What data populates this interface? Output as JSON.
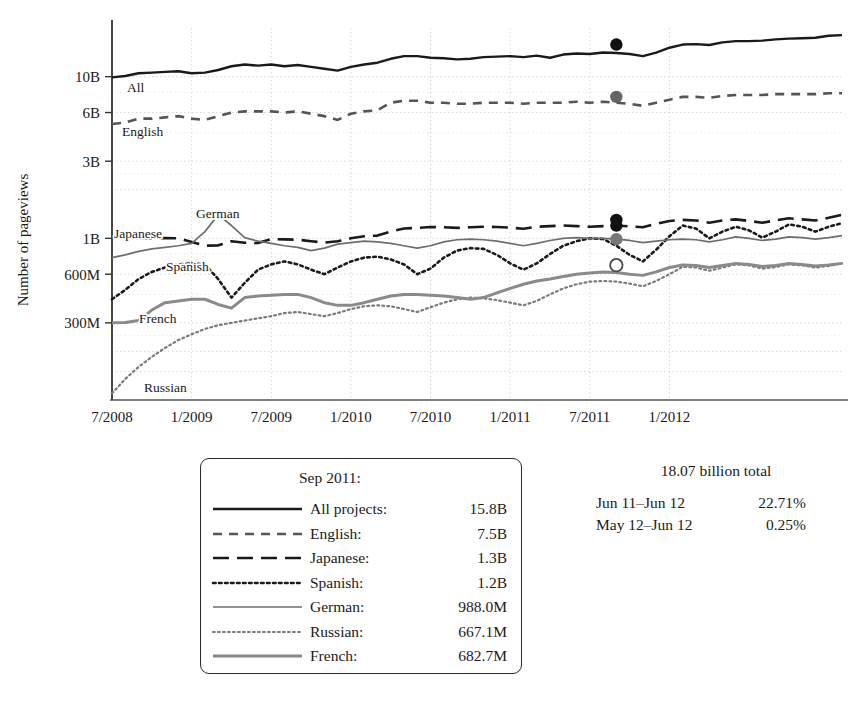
{
  "chart_data": {
    "type": "line",
    "title": "",
    "xlabel": "",
    "ylabel": "Number of pageviews",
    "scale": "log",
    "grid": true,
    "legend_position": "below-left",
    "x_tick_labels": [
      "7/2008",
      "1/2009",
      "7/2009",
      "1/2010",
      "7/2010",
      "1/2011",
      "7/2011",
      "1/2012"
    ],
    "y_tick_labels": [
      "10B",
      "6B",
      "3B",
      "1B",
      "600M",
      "300M"
    ],
    "y_tick_values": [
      10000,
      6000,
      3000,
      1000,
      600,
      300
    ],
    "ylim": [
      100,
      20000
    ],
    "x_start": "7/2008",
    "x_end": "6/2012",
    "highlight_month": "Sep 2011",
    "series": [
      {
        "name": "All projects",
        "short_name": "All",
        "style": "solid",
        "color": "#1a1a1a",
        "width": 2.4,
        "inline_label": "All",
        "marker": {
          "type": "filled",
          "color": "#111111",
          "month": "Sep 2011",
          "value": 15800
        },
        "values": [
          9900,
          10100,
          10500,
          10600,
          10700,
          10800,
          10500,
          10600,
          11000,
          11600,
          11900,
          11700,
          11900,
          11600,
          11800,
          11500,
          11200,
          10900,
          11500,
          11900,
          12200,
          12900,
          13400,
          13400,
          13100,
          13000,
          12800,
          12900,
          13200,
          13300,
          13400,
          13200,
          13500,
          13100,
          13700,
          13900,
          13800,
          14100,
          14000,
          13800,
          13400,
          14100,
          15100,
          15800,
          15900,
          15700,
          16300,
          16600,
          16600,
          16700,
          17000,
          17200,
          17300,
          17400,
          17900,
          18070
        ]
      },
      {
        "name": "English",
        "short_name": "English",
        "style": "dashed",
        "color": "#555555",
        "width": 2.6,
        "inline_label": "English",
        "marker": {
          "type": "filled",
          "color": "#666666",
          "month": "Sep 2011",
          "value": 7500
        },
        "values": [
          5100,
          5200,
          5500,
          5500,
          5600,
          5700,
          5500,
          5400,
          5700,
          6000,
          6100,
          6100,
          6100,
          6000,
          6100,
          5900,
          5700,
          5400,
          5900,
          6100,
          6200,
          6900,
          7100,
          7100,
          6900,
          6900,
          6800,
          6800,
          6900,
          6900,
          6900,
          6800,
          6900,
          6900,
          6900,
          7000,
          6900,
          7000,
          6900,
          6800,
          6600,
          6900,
          7200,
          7500,
          7500,
          7400,
          7600,
          7700,
          7700,
          7700,
          7800,
          7800,
          7800,
          7800,
          7900,
          7900
        ]
      },
      {
        "name": "Japanese",
        "short_name": "Japanese",
        "style": "longdash",
        "color": "#1a1a1a",
        "width": 2.6,
        "inline_label": "Japanese",
        "marker": {
          "type": "filled",
          "color": "#111111",
          "month": "Sep 2011",
          "value": 1300
        },
        "values": [
          1010,
          1010,
          1000,
          1000,
          1005,
          1000,
          950,
          900,
          905,
          960,
          940,
          935,
          990,
          985,
          980,
          960,
          940,
          960,
          1000,
          1030,
          1040,
          1100,
          1150,
          1160,
          1175,
          1170,
          1160,
          1170,
          1180,
          1175,
          1165,
          1145,
          1180,
          1190,
          1200,
          1190,
          1180,
          1190,
          1200,
          1185,
          1170,
          1230,
          1280,
          1300,
          1290,
          1250,
          1290,
          1310,
          1280,
          1250,
          1290,
          1330,
          1310,
          1290,
          1340,
          1400
        ]
      },
      {
        "name": "Spanish",
        "short_name": "Spanish",
        "style": "dotted",
        "color": "#1a1a1a",
        "width": 2.6,
        "inline_label": "Spanish",
        "marker": {
          "type": "filled",
          "color": "#111111",
          "month": "Sep 2011",
          "value": 1200
        },
        "values": [
          420,
          480,
          560,
          620,
          660,
          690,
          700,
          690,
          560,
          430,
          530,
          640,
          690,
          720,
          690,
          640,
          600,
          660,
          720,
          760,
          770,
          740,
          690,
          600,
          650,
          760,
          840,
          870,
          860,
          790,
          700,
          640,
          700,
          800,
          900,
          960,
          1000,
          990,
          900,
          790,
          720,
          850,
          1030,
          1200,
          1150,
          1000,
          1100,
          1180,
          1120,
          1010,
          1100,
          1220,
          1180,
          1100,
          1180,
          1240
        ]
      },
      {
        "name": "German",
        "short_name": "German",
        "style": "solid-thin",
        "color": "#6e6e6e",
        "width": 1.7,
        "inline_label": "German",
        "marker": {
          "type": "filled",
          "color": "#777777",
          "month": "Sep 2011",
          "value": 988
        },
        "values": [
          760,
          790,
          830,
          860,
          880,
          900,
          930,
          1100,
          1400,
          1200,
          1010,
          960,
          930,
          900,
          880,
          840,
          870,
          920,
          940,
          960,
          950,
          930,
          900,
          870,
          900,
          950,
          980,
          990,
          980,
          960,
          930,
          900,
          930,
          970,
          1000,
          1010,
          1000,
          1000,
          990,
          970,
          940,
          960,
          980,
          988,
          980,
          950,
          980,
          1020,
          1000,
          970,
          990,
          1020,
          1010,
          990,
          1010,
          1040
        ]
      },
      {
        "name": "Russian",
        "short_name": "Russian",
        "style": "fine-dotted",
        "color": "#7a7a7a",
        "width": 2.2,
        "inline_label": "Russian",
        "marker": null,
        "values": [
          110,
          135,
          160,
          185,
          210,
          235,
          255,
          275,
          290,
          300,
          310,
          320,
          330,
          345,
          350,
          340,
          330,
          345,
          365,
          380,
          385,
          380,
          365,
          350,
          375,
          400,
          420,
          430,
          425,
          415,
          400,
          385,
          410,
          450,
          490,
          520,
          540,
          545,
          540,
          525,
          505,
          545,
          600,
          667,
          660,
          630,
          660,
          690,
          680,
          650,
          665,
          690,
          680,
          660,
          675,
          700
        ]
      },
      {
        "name": "French",
        "short_name": "French",
        "style": "solid-gray",
        "color": "#8a8a8a",
        "width": 3.0,
        "inline_label": "French",
        "marker": {
          "type": "open",
          "color": "#ffffff",
          "month": "Sep 2011",
          "value": 682.7
        },
        "values": [
          300,
          302,
          310,
          360,
          400,
          410,
          420,
          420,
          390,
          370,
          430,
          440,
          445,
          450,
          450,
          430,
          400,
          385,
          385,
          400,
          420,
          440,
          450,
          450,
          445,
          440,
          430,
          420,
          430,
          460,
          490,
          520,
          545,
          560,
          580,
          600,
          610,
          620,
          615,
          600,
          590,
          620,
          660,
          683,
          680,
          660,
          680,
          700,
          690,
          670,
          680,
          700,
          690,
          675,
          685,
          700
        ]
      }
    ]
  },
  "inline_labels": [
    {
      "text": "All",
      "x": 127,
      "y": 92
    },
    {
      "text": "English",
      "x": 122,
      "y": 136
    },
    {
      "text": "Japanese",
      "x": 114,
      "y": 238
    },
    {
      "text": "German",
      "x": 196,
      "y": 218
    },
    {
      "text": "Spanish",
      "x": 166,
      "y": 271
    },
    {
      "text": "French",
      "x": 139,
      "y": 323
    },
    {
      "text": "Russian",
      "x": 144,
      "y": 392
    }
  ],
  "legend": {
    "title": "Sep 2011:",
    "rows": [
      {
        "name": "All projects:",
        "value": "15.8B",
        "style": "solid",
        "color": "#1a1a1a"
      },
      {
        "name": "English:",
        "value": "7.5B",
        "style": "dashed",
        "color": "#555555"
      },
      {
        "name": "Japanese:",
        "value": "1.3B",
        "style": "longdash",
        "color": "#1a1a1a"
      },
      {
        "name": "Spanish:",
        "value": "1.2B",
        "style": "dotted",
        "color": "#1a1a1a"
      },
      {
        "name": "German:",
        "value": "988.0M",
        "style": "solid-thin",
        "color": "#6e6e6e"
      },
      {
        "name": "Russian:",
        "value": "667.1M",
        "style": "fine-dotted",
        "color": "#7a7a7a"
      },
      {
        "name": "French:",
        "value": "682.7M",
        "style": "solid-gray",
        "color": "#8a8a8a"
      }
    ]
  },
  "stats": {
    "total": "18.07 billion total",
    "rows": [
      {
        "label": "Jun 11–Jun 12",
        "value": "22.71%"
      },
      {
        "label": "May 12–Jun 12",
        "value": "0.25%"
      }
    ]
  }
}
